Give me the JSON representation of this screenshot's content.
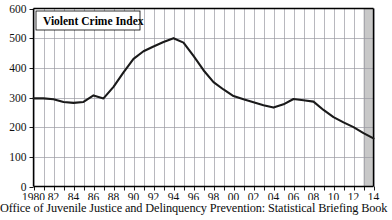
{
  "caption": "Office of Juvenile Justice and Delinquency Prevention: Statistical Briefing Book",
  "legend": {
    "label": "Violent Crime Index"
  },
  "colors": {
    "line": "#1a1a1a",
    "axis": "#000000",
    "grid": "#9a9aa2",
    "shaded_band": "#c8c8c8",
    "background": "#ffffff",
    "text": "#000000"
  },
  "chart_data": {
    "type": "line",
    "title": "Violent Crime Index",
    "xlabel": "",
    "ylabel": "",
    "xlim": [
      1980,
      2014
    ],
    "ylim": [
      0,
      600
    ],
    "yticks": [
      0,
      100,
      200,
      300,
      400,
      500,
      600
    ],
    "ytick_labels": [
      "0",
      "100",
      "200",
      "300",
      "400",
      "500",
      "600"
    ],
    "xticks": [
      1980,
      1981,
      1982,
      1983,
      1984,
      1985,
      1986,
      1987,
      1988,
      1989,
      1990,
      1991,
      1992,
      1993,
      1994,
      1995,
      1996,
      1997,
      1998,
      1999,
      2000,
      2001,
      2002,
      2003,
      2004,
      2005,
      2006,
      2007,
      2008,
      2009,
      2010,
      2011,
      2012,
      2013,
      2014
    ],
    "xtick_labels": [
      "1980",
      "",
      "82",
      "",
      "84",
      "",
      "86",
      "",
      "88",
      "",
      "90",
      "",
      "92",
      "",
      "94",
      "",
      "96",
      "",
      "98",
      "",
      "00",
      "",
      "02",
      "",
      "04",
      "",
      "06",
      "",
      "08",
      "",
      "10",
      "",
      "12",
      "",
      "14"
    ],
    "grid": true,
    "grid_axis": "both",
    "legend_position": "top-left-inside",
    "shaded_region": {
      "x_start": 2013,
      "x_end": 2014,
      "note": "gray band at right edge"
    },
    "series": [
      {
        "name": "Violent Crime Index",
        "x": [
          1980,
          1981,
          1982,
          1983,
          1984,
          1985,
          1986,
          1987,
          1988,
          1989,
          1990,
          1991,
          1992,
          1993,
          1994,
          1995,
          1996,
          1997,
          1998,
          1999,
          2000,
          2001,
          2002,
          2003,
          2004,
          2005,
          2006,
          2007,
          2008,
          2009,
          2010,
          2011,
          2012,
          2013,
          2014
        ],
        "values": [
          297,
          297,
          294,
          285,
          282,
          285,
          307,
          297,
          336,
          385,
          430,
          456,
          472,
          487,
          500,
          485,
          440,
          392,
          352,
          327,
          305,
          294,
          284,
          274,
          266,
          277,
          295,
          291,
          286,
          258,
          234,
          216,
          200,
          180,
          162
        ]
      }
    ]
  }
}
